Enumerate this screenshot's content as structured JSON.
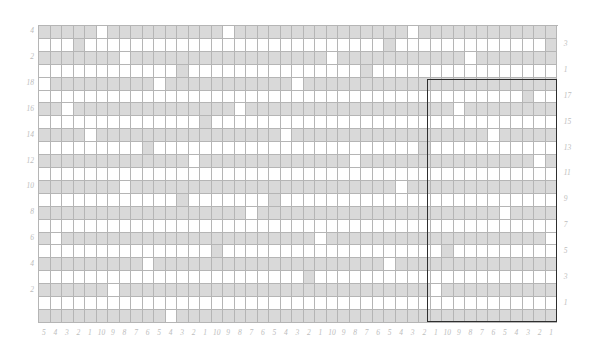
{
  "chart_data": {
    "type": "heatmap",
    "title": "",
    "subtitle": "",
    "xlabel": "",
    "ylabel": "",
    "grid": true,
    "legend_position": "none",
    "columns": 45,
    "rows": 23,
    "cell_width": 11.53,
    "cell_height": 12.91,
    "origin_x": 38,
    "origin_y": 25,
    "colors": {
      "filled": "#d9d9d9",
      "blank": "#ffffff",
      "gridline": "#b5b5b5",
      "repeat_border": "#2e2e2e",
      "label": "#bdbdbd"
    },
    "value_legend": {
      "0": "blank stitch",
      "1": "shaded stitch"
    },
    "row_labels_left": [
      "4",
      "",
      "2",
      "",
      "18",
      "",
      "16",
      "",
      "14",
      "",
      "12",
      "",
      "10",
      "",
      "8",
      "",
      "6",
      "",
      "4",
      "",
      "2",
      "",
      ""
    ],
    "row_labels_right": [
      "",
      "3",
      "",
      "1",
      "",
      "17",
      "",
      "15",
      "",
      "13",
      "",
      "11",
      "",
      "9",
      "",
      "7",
      "",
      "5",
      "",
      "3",
      "",
      "1",
      ""
    ],
    "column_labels": [
      "1",
      "9",
      "8",
      "7",
      "6",
      "5",
      "4",
      "3",
      "2",
      "1",
      "9",
      "8",
      "7",
      "6",
      "5",
      "4",
      "3",
      "2",
      "1",
      "9",
      "8",
      "7",
      "6",
      "5",
      "4",
      "3",
      "2",
      "1",
      "9",
      "8",
      "7",
      "6",
      "5",
      "4",
      "3",
      "2",
      "1",
      "9",
      "8",
      "7",
      "6",
      "5",
      "4",
      "3",
      "2",
      "1"
    ],
    "repeat_box": {
      "start_col": 34,
      "end_col": 45,
      "start_row": 4,
      "end_row": 23,
      "x": 427,
      "y": 79,
      "width": 130,
      "height": 243
    },
    "matrix": [
      [
        1,
        1,
        1,
        1,
        1,
        0,
        1,
        1,
        1,
        1,
        1,
        1,
        1,
        1,
        1,
        1,
        0,
        1,
        1,
        1,
        1,
        1,
        1,
        1,
        1,
        1,
        1,
        1,
        1,
        1,
        1,
        1,
        0,
        1,
        1,
        1,
        1,
        1,
        1,
        1,
        1,
        1,
        1,
        1,
        1
      ],
      [
        0,
        0,
        0,
        1,
        0,
        0,
        0,
        0,
        0,
        0,
        0,
        0,
        0,
        0,
        0,
        0,
        0,
        0,
        0,
        0,
        0,
        0,
        0,
        0,
        0,
        0,
        0,
        0,
        0,
        0,
        1,
        0,
        0,
        0,
        0,
        0,
        0,
        0,
        0,
        0,
        0,
        0,
        0,
        0,
        1
      ],
      [
        1,
        1,
        1,
        1,
        1,
        1,
        1,
        0,
        1,
        1,
        1,
        1,
        1,
        1,
        1,
        1,
        1,
        1,
        1,
        1,
        1,
        1,
        1,
        1,
        1,
        0,
        1,
        1,
        1,
        1,
        1,
        1,
        1,
        1,
        1,
        1,
        1,
        0,
        1,
        1,
        1,
        1,
        1,
        1,
        1
      ],
      [
        0,
        0,
        0,
        0,
        0,
        0,
        0,
        0,
        0,
        0,
        0,
        0,
        1,
        0,
        0,
        0,
        0,
        0,
        0,
        0,
        0,
        0,
        0,
        0,
        0,
        0,
        0,
        0,
        1,
        0,
        0,
        0,
        0,
        0,
        0,
        0,
        0,
        0,
        0,
        0,
        0,
        0,
        0,
        0,
        0
      ],
      [
        0,
        1,
        1,
        1,
        1,
        1,
        1,
        1,
        1,
        1,
        0,
        1,
        1,
        1,
        1,
        1,
        1,
        1,
        1,
        1,
        1,
        1,
        0,
        1,
        1,
        1,
        1,
        1,
        1,
        1,
        1,
        1,
        1,
        1,
        1,
        1,
        1,
        1,
        1,
        1,
        1,
        1,
        1,
        1,
        1
      ],
      [
        0,
        0,
        0,
        0,
        0,
        0,
        0,
        0,
        0,
        0,
        0,
        0,
        0,
        0,
        0,
        0,
        0,
        0,
        0,
        0,
        0,
        0,
        0,
        0,
        0,
        0,
        0,
        0,
        0,
        0,
        0,
        0,
        0,
        0,
        0,
        0,
        0,
        0,
        0,
        0,
        0,
        0,
        1,
        0,
        0
      ],
      [
        1,
        1,
        0,
        1,
        1,
        1,
        1,
        1,
        1,
        1,
        1,
        1,
        1,
        1,
        1,
        1,
        1,
        0,
        1,
        1,
        1,
        1,
        1,
        1,
        1,
        1,
        1,
        1,
        1,
        1,
        1,
        1,
        1,
        1,
        1,
        1,
        0,
        1,
        1,
        1,
        1,
        1,
        1,
        1,
        1
      ],
      [
        0,
        0,
        0,
        0,
        0,
        0,
        0,
        0,
        0,
        0,
        0,
        0,
        0,
        0,
        1,
        0,
        0,
        0,
        0,
        0,
        0,
        0,
        0,
        0,
        0,
        0,
        0,
        0,
        0,
        0,
        0,
        0,
        0,
        0,
        0,
        0,
        0,
        0,
        0,
        0,
        0,
        0,
        0,
        0,
        0
      ],
      [
        1,
        1,
        1,
        1,
        0,
        1,
        1,
        1,
        1,
        1,
        1,
        1,
        1,
        1,
        1,
        1,
        1,
        1,
        1,
        1,
        1,
        0,
        1,
        1,
        1,
        1,
        1,
        1,
        1,
        1,
        1,
        1,
        1,
        1,
        1,
        1,
        1,
        1,
        1,
        0,
        1,
        1,
        1,
        1,
        1
      ],
      [
        0,
        0,
        0,
        0,
        0,
        0,
        0,
        0,
        0,
        1,
        0,
        0,
        0,
        0,
        0,
        0,
        0,
        0,
        0,
        0,
        0,
        0,
        0,
        0,
        0,
        0,
        0,
        0,
        0,
        0,
        0,
        0,
        0,
        1,
        0,
        0,
        0,
        0,
        0,
        0,
        0,
        0,
        0,
        0,
        0
      ],
      [
        1,
        1,
        1,
        1,
        1,
        1,
        1,
        1,
        1,
        1,
        1,
        1,
        1,
        0,
        1,
        1,
        1,
        1,
        1,
        1,
        1,
        1,
        1,
        1,
        1,
        1,
        1,
        0,
        1,
        1,
        1,
        1,
        1,
        1,
        1,
        1,
        1,
        1,
        1,
        1,
        1,
        1,
        1,
        0,
        1
      ],
      [
        0,
        0,
        0,
        0,
        0,
        0,
        0,
        0,
        0,
        0,
        0,
        0,
        0,
        0,
        0,
        0,
        0,
        0,
        0,
        0,
        0,
        0,
        0,
        0,
        0,
        0,
        0,
        0,
        0,
        0,
        0,
        0,
        0,
        0,
        0,
        0,
        0,
        0,
        0,
        0,
        0,
        0,
        0,
        0,
        0
      ],
      [
        1,
        1,
        1,
        1,
        1,
        1,
        1,
        0,
        1,
        1,
        1,
        1,
        1,
        1,
        1,
        1,
        1,
        1,
        1,
        1,
        1,
        1,
        1,
        1,
        1,
        1,
        1,
        1,
        1,
        1,
        1,
        0,
        1,
        1,
        1,
        1,
        1,
        1,
        1,
        1,
        1,
        1,
        1,
        1,
        1
      ],
      [
        0,
        0,
        0,
        0,
        0,
        0,
        0,
        0,
        0,
        0,
        0,
        0,
        1,
        0,
        0,
        0,
        0,
        0,
        0,
        0,
        1,
        0,
        0,
        0,
        0,
        0,
        0,
        0,
        0,
        0,
        0,
        0,
        0,
        0,
        0,
        0,
        0,
        0,
        0,
        0,
        0,
        0,
        0,
        0,
        0
      ],
      [
        1,
        1,
        1,
        1,
        1,
        1,
        1,
        1,
        1,
        1,
        1,
        1,
        1,
        1,
        1,
        1,
        1,
        1,
        0,
        1,
        1,
        1,
        1,
        1,
        1,
        1,
        1,
        1,
        1,
        1,
        1,
        1,
        1,
        1,
        1,
        1,
        1,
        1,
        1,
        1,
        0,
        1,
        1,
        1,
        1
      ],
      [
        0,
        0,
        0,
        0,
        0,
        0,
        0,
        0,
        0,
        0,
        0,
        0,
        0,
        0,
        0,
        0,
        0,
        0,
        0,
        0,
        0,
        0,
        0,
        0,
        0,
        0,
        0,
        0,
        0,
        0,
        0,
        0,
        0,
        0,
        0,
        0,
        0,
        0,
        0,
        0,
        0,
        0,
        0,
        0,
        0
      ],
      [
        1,
        0,
        1,
        1,
        1,
        1,
        1,
        1,
        1,
        1,
        1,
        1,
        1,
        1,
        1,
        1,
        1,
        1,
        1,
        1,
        1,
        1,
        1,
        1,
        0,
        1,
        1,
        1,
        1,
        1,
        1,
        1,
        1,
        1,
        1,
        1,
        1,
        1,
        1,
        1,
        1,
        1,
        1,
        1,
        0
      ],
      [
        0,
        0,
        0,
        0,
        0,
        0,
        0,
        0,
        0,
        0,
        0,
        0,
        0,
        0,
        0,
        1,
        0,
        0,
        0,
        0,
        0,
        0,
        0,
        0,
        0,
        0,
        0,
        0,
        0,
        0,
        0,
        0,
        0,
        0,
        0,
        1,
        0,
        0,
        0,
        0,
        0,
        0,
        0,
        0,
        0
      ],
      [
        1,
        1,
        1,
        1,
        1,
        1,
        1,
        1,
        1,
        0,
        1,
        1,
        1,
        1,
        1,
        1,
        1,
        1,
        1,
        1,
        1,
        1,
        1,
        1,
        1,
        1,
        1,
        1,
        1,
        1,
        0,
        1,
        1,
        1,
        1,
        1,
        1,
        1,
        1,
        1,
        1,
        1,
        1,
        1,
        1
      ],
      [
        0,
        0,
        0,
        0,
        0,
        0,
        0,
        0,
        0,
        0,
        0,
        0,
        0,
        0,
        0,
        0,
        0,
        0,
        0,
        0,
        0,
        0,
        0,
        1,
        0,
        0,
        0,
        0,
        0,
        0,
        0,
        0,
        0,
        0,
        0,
        0,
        0,
        0,
        0,
        0,
        0,
        0,
        0,
        0,
        0
      ],
      [
        1,
        1,
        1,
        1,
        1,
        1,
        0,
        1,
        1,
        1,
        1,
        1,
        1,
        1,
        1,
        1,
        1,
        1,
        1,
        1,
        1,
        1,
        1,
        1,
        1,
        1,
        1,
        1,
        1,
        1,
        1,
        1,
        1,
        1,
        0,
        1,
        1,
        1,
        1,
        1,
        1,
        1,
        1,
        1,
        1
      ],
      [
        0,
        0,
        0,
        0,
        0,
        0,
        0,
        0,
        0,
        0,
        0,
        0,
        0,
        0,
        0,
        0,
        0,
        0,
        0,
        0,
        0,
        0,
        0,
        0,
        0,
        0,
        0,
        0,
        0,
        0,
        0,
        0,
        0,
        0,
        0,
        0,
        0,
        0,
        0,
        0,
        0,
        0,
        0,
        0,
        0
      ],
      [
        1,
        1,
        1,
        1,
        1,
        1,
        1,
        1,
        1,
        1,
        1,
        0,
        1,
        1,
        1,
        1,
        1,
        1,
        1,
        1,
        1,
        1,
        1,
        1,
        1,
        1,
        1,
        1,
        1,
        1,
        1,
        1,
        1,
        1,
        1,
        1,
        1,
        1,
        1,
        1,
        1,
        1,
        1,
        1,
        1
      ]
    ]
  }
}
